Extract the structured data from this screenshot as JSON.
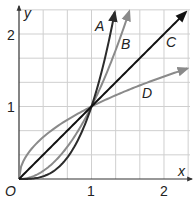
{
  "chart_data": {
    "type": "line",
    "title": "",
    "xlabel": "x",
    "ylabel": "y",
    "origin_label": "O",
    "xlim": [
      0,
      2.35
    ],
    "ylim": [
      0,
      2.35
    ],
    "grid": true,
    "grid_step": 0.3333,
    "x_ticks": [
      {
        "value": 1,
        "label": "1"
      },
      {
        "value": 2,
        "label": "2"
      }
    ],
    "y_ticks": [
      {
        "value": 1,
        "label": "1"
      },
      {
        "value": 2,
        "label": "2"
      }
    ],
    "series": [
      {
        "name": "A",
        "function": "y = x^3",
        "color": "#2b2b2b",
        "x": [
          0,
          0.25,
          0.5,
          0.75,
          1,
          1.2,
          1.32
        ],
        "y": [
          0,
          0.016,
          0.125,
          0.42,
          1,
          1.73,
          2.3
        ]
      },
      {
        "name": "B",
        "function": "y = x^2",
        "color": "#8a8a8a",
        "x": [
          0,
          0.25,
          0.5,
          0.75,
          1,
          1.25,
          1.52
        ],
        "y": [
          0,
          0.0625,
          0.25,
          0.5625,
          1,
          1.5625,
          2.31
        ]
      },
      {
        "name": "C",
        "function": "y = x",
        "color": "#111111",
        "x": [
          0,
          1,
          2.3
        ],
        "y": [
          0,
          1,
          2.3
        ]
      },
      {
        "name": "D",
        "function": "y = sqrt(x)",
        "color": "#8a8a8a",
        "x": [
          0,
          0.25,
          0.5,
          1,
          1.5,
          2,
          2.3
        ],
        "y": [
          0,
          0.5,
          0.707,
          1,
          1.225,
          1.414,
          1.517
        ]
      }
    ],
    "legend": "inline labels A, B, C, D near curve ends",
    "annotations": [
      "A",
      "B",
      "C",
      "D"
    ]
  },
  "labels": {
    "x_axis": "x",
    "y_axis": "y",
    "origin": "O",
    "x1": "1",
    "x2": "2",
    "y1": "1",
    "y2": "2",
    "A": "A",
    "B": "B",
    "C": "C",
    "D": "D"
  }
}
